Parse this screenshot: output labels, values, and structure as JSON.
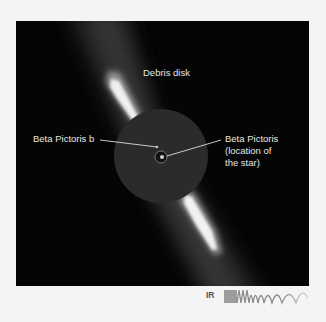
{
  "figure": {
    "labels": {
      "debris_disk": "Debris disk",
      "planet": "Beta Pictoris b",
      "star_line1": "Beta Pictoris",
      "star_line2": "(location of",
      "star_line3": "the star)"
    },
    "spectrum_band": {
      "label": "IR",
      "icon": "wave-spectrum-icon"
    },
    "colors": {
      "background": "#f4f4f4",
      "frame": "#050505",
      "mask_disc": "#2b2b2b",
      "label_text": "#e6e6e6",
      "leader_line": "#dcdcdc",
      "spectrum": "#888888"
    }
  }
}
